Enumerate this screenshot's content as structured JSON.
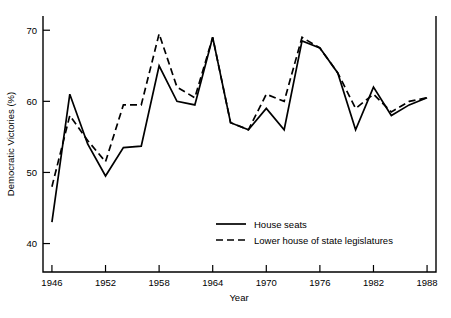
{
  "chart_data": {
    "type": "line",
    "title": "",
    "xlabel": "Year",
    "ylabel": "Democratic Victories (%)",
    "xlim": [
      1945,
      1989
    ],
    "ylim": [
      36,
      72
    ],
    "xticks": [
      1946,
      1952,
      1958,
      1964,
      1970,
      1976,
      1982,
      1988
    ],
    "yticks": [
      40,
      50,
      60,
      70
    ],
    "xtick_labels": [
      "1946",
      "1952",
      "1958",
      "1964",
      "1970",
      "1976",
      "1982",
      "1988"
    ],
    "ytick_labels": [
      "40",
      "50",
      "60",
      "70"
    ],
    "grid": false,
    "legend_position": "lower center",
    "x": [
      1946,
      1948,
      1950,
      1952,
      1954,
      1956,
      1958,
      1960,
      1962,
      1964,
      1966,
      1968,
      1970,
      1972,
      1974,
      1976,
      1978,
      1980,
      1982,
      1984,
      1986,
      1988
    ],
    "series": [
      {
        "name": "House seats",
        "style": "solid",
        "color": "#000000",
        "values": [
          43.0,
          61.0,
          54.0,
          49.5,
          53.5,
          53.7,
          65.0,
          60.0,
          59.5,
          69.0,
          57.0,
          56.0,
          59.0,
          56.0,
          68.5,
          67.5,
          64.0,
          56.0,
          62.0,
          58.0,
          59.5,
          60.5
        ]
      },
      {
        "name": "Lower house of state legislatures",
        "style": "dashed",
        "color": "#000000",
        "values": [
          48.0,
          58.0,
          54.5,
          51.5,
          59.5,
          59.5,
          69.5,
          62.0,
          60.5,
          69.0,
          57.0,
          56.0,
          61.0,
          60.0,
          69.0,
          67.5,
          64.0,
          59.0,
          61.0,
          58.5,
          60.0,
          60.5
        ]
      }
    ]
  },
  "legend": {
    "items": [
      {
        "label": "House seats",
        "style": "solid"
      },
      {
        "label": "Lower house of state legislatures",
        "style": "dashed"
      }
    ]
  }
}
